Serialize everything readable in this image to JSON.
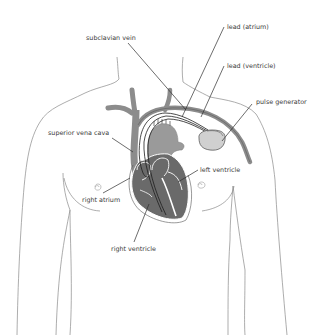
{
  "diagram": {
    "type": "anatomical-illustration",
    "colors": {
      "background": "#ffffff",
      "body_outline": "#8a8a8a",
      "vein": "#8c8c8c",
      "heart_dark": "#6a6a6a",
      "heart_mid": "#9a9a9a",
      "heart_outline": "#ffffff",
      "lead_wire": "#1e1e1e",
      "pulse_generator_fill": "#d0d0d0",
      "label_text": "#3a3a3a"
    },
    "labels": {
      "lead_atrium": "lead (atrium)",
      "subclavian_vein": "subclavian vein",
      "lead_ventricle": "lead (ventricle)",
      "pulse_generator": "pulse generator",
      "superior_vena_cava": "superior vena cava",
      "left_ventricle": "left ventricle",
      "right_atrium": "right atrium",
      "right_ventricle": "right ventricle"
    }
  }
}
